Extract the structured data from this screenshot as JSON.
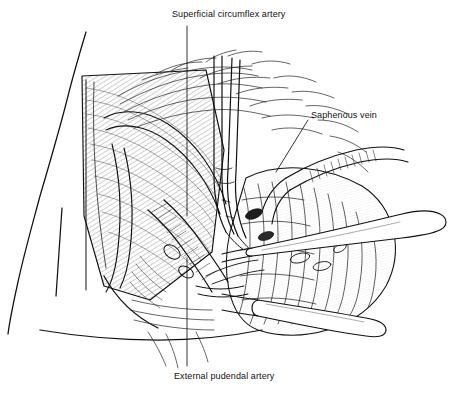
{
  "figure": {
    "background_color": "#ffffff",
    "ink_color": "#111111",
    "width": 460,
    "height": 400
  },
  "labels": [
    {
      "id": "superficial-circumflex-artery",
      "text": "Superficial circumflex artery",
      "position": "top-center",
      "leader": "vertical line descending from label to dissection field"
    },
    {
      "id": "saphenous-vein",
      "text": "Saphenous vein",
      "position": "upper-right",
      "leader": "diagonal line descending left toward vein"
    },
    {
      "id": "external-pudendal-artery",
      "text": "External pudendal artery",
      "position": "bottom-center",
      "leader": "vertical line ascending from label to dissection field"
    }
  ],
  "structures": [
    {
      "name": "body-contour",
      "description": "torso and thigh outline, left side"
    },
    {
      "name": "fascia-lata",
      "description": "hatched fascial sheet, upper left"
    },
    {
      "name": "fossa-ovalis",
      "description": "oval opening in fascia"
    },
    {
      "name": "subcutaneous-fat",
      "description": "lobulated fatty tissue, right of field"
    },
    {
      "name": "femoral-vessels",
      "description": "vessel bundle in center of dissection"
    }
  ],
  "instruments": [
    {
      "name": "forceps",
      "description": "fine tipped forceps entering vertically from top"
    },
    {
      "name": "retractor-upper",
      "description": "rounded-tip retractor, upper right"
    },
    {
      "name": "retractor-lower",
      "description": "rounded-tip retractor, lower right"
    }
  ]
}
